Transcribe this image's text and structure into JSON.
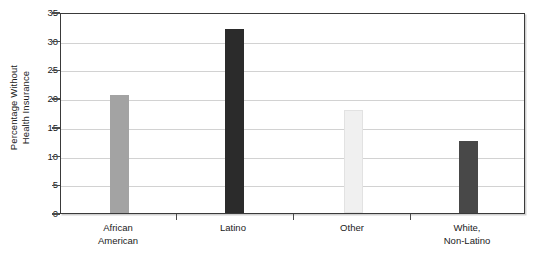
{
  "chart_data": {
    "type": "bar",
    "title": "",
    "subtitle": "",
    "xlabel": "",
    "ylabel": "Percentage Without Health Insurance",
    "ylabel_lines": [
      "Percentage Without",
      "Health Insurance"
    ],
    "categories": [
      "African American",
      "Latino",
      "Other",
      "White, Non-Latino"
    ],
    "category_lines": [
      [
        "African",
        "American"
      ],
      [
        "Latino",
        ""
      ],
      [
        "Other",
        ""
      ],
      [
        "White,",
        "Non-Latino"
      ]
    ],
    "values": [
      20.5,
      32.0,
      18.0,
      12.5
    ],
    "bar_colors": [
      "#a3a3a3",
      "#2b2b2b",
      "#f0f0f0",
      "#484848"
    ],
    "ylim": [
      0,
      35
    ],
    "ytick_values": [
      0,
      5,
      10,
      15,
      20,
      25,
      30,
      35
    ],
    "ytick_labels": [
      "0",
      "5",
      "10",
      "15",
      "20",
      "25",
      "30",
      "35"
    ],
    "grid": true,
    "grid_axis": "y",
    "legend": false,
    "legend_position": "none",
    "plot_background": "#ffffff",
    "frame_color": "#3a3a3a",
    "gridline_color": "#d2d2d2",
    "bar_width_px": 19,
    "bar_centers_px": [
      118,
      233,
      352,
      467
    ]
  }
}
